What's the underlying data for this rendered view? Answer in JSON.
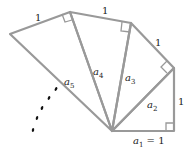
{
  "diagram": {
    "labels": {
      "side_top_left": "1",
      "side_top": "1",
      "side_right_upper": "1",
      "side_right": "1",
      "a1": "a",
      "a1_sub": "1",
      "a1_eq": " = 1",
      "a2": "a",
      "a2_sub": "2",
      "a3": "a",
      "a3_sub": "3",
      "a4": "a",
      "a4_sub": "4",
      "a5": "a",
      "a5_sub": "5"
    },
    "colors": {
      "line": "#999999",
      "dots": "#111111"
    }
  }
}
